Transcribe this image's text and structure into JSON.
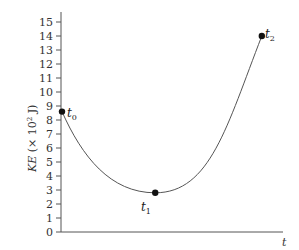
{
  "chart_data": {
    "type": "line",
    "title": "",
    "xlabel": "t",
    "ylabel": "KE (× 10² J)",
    "ylim": [
      0,
      15
    ],
    "yticks": [
      0,
      1,
      2,
      3,
      4,
      5,
      6,
      7,
      8,
      9,
      10,
      11,
      12,
      13,
      14,
      15
    ],
    "xticks": [],
    "grid": false,
    "legend": null,
    "series": [
      {
        "name": "KE",
        "points": [
          {
            "label": "t0",
            "x": 0.0,
            "y": 8.6
          },
          {
            "label": "t1",
            "x": 0.42,
            "y": 2.8
          },
          {
            "label": "t2",
            "x": 0.9,
            "y": 14.0
          }
        ]
      }
    ],
    "annotations": [
      {
        "text": "t",
        "sub": "0",
        "at": "t0"
      },
      {
        "text": "t",
        "sub": "1",
        "at": "t1"
      },
      {
        "text": "t",
        "sub": "2",
        "at": "t2"
      }
    ]
  },
  "labels": {
    "y_main": "KE",
    "y_rest": " (× 10",
    "y_exp": "2",
    "y_unit": " J)",
    "x": "t",
    "t0": "t",
    "t0_sub": "0",
    "t1": "t",
    "t1_sub": "1",
    "t2": "t",
    "t2_sub": "2"
  }
}
